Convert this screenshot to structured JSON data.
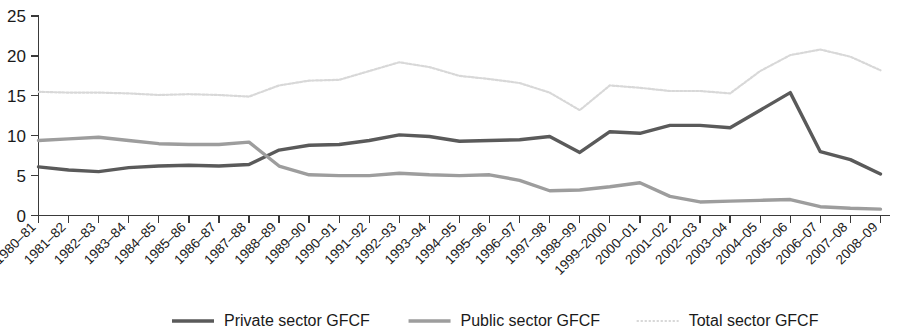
{
  "chart_data": {
    "type": "line",
    "title": "",
    "subtitle": "",
    "xlabel": "",
    "ylabel": "",
    "ylim": [
      0,
      25
    ],
    "yticks": [
      0,
      5,
      10,
      15,
      20,
      25
    ],
    "grid": false,
    "legend_position": "bottom",
    "categories": [
      "1980–81",
      "1981–82",
      "1982–83",
      "1983–84",
      "1984–85",
      "1985–86",
      "1986–87",
      "1987–88",
      "1988–89",
      "1989–90",
      "1990–91",
      "1991–92",
      "1992–93",
      "1993–94",
      "1994–95",
      "1995–96",
      "1996–97",
      "1997–98",
      "1998–99",
      "1999–2000",
      "2000–01",
      "2001–02",
      "2002–03",
      "2003–04",
      "2004–05",
      "2005–06",
      "2006–07",
      "2007–08",
      "2008–09"
    ],
    "series": [
      {
        "name": "Private sector GFCF",
        "color": "#5a5a5a",
        "width": 3.4,
        "dash": "",
        "values": [
          6.1,
          5.7,
          5.5,
          6.0,
          6.2,
          6.3,
          6.2,
          6.4,
          8.2,
          8.8,
          8.9,
          9.4,
          10.1,
          9.9,
          9.3,
          9.4,
          9.5,
          9.9,
          7.9,
          10.5,
          10.3,
          11.3,
          11.3,
          11.0,
          13.2,
          15.4,
          8.0,
          7.0,
          5.2
        ]
      },
      {
        "name": "Public sector GFCF",
        "color": "#9d9d9d",
        "width": 3.4,
        "dash": "",
        "values": [
          9.4,
          9.6,
          9.8,
          9.4,
          9.0,
          8.9,
          8.9,
          9.2,
          6.2,
          5.1,
          5.0,
          5.0,
          5.3,
          5.1,
          5.0,
          5.1,
          4.4,
          3.1,
          3.2,
          3.6,
          4.1,
          2.4,
          1.7,
          1.8,
          1.9,
          2.0,
          1.1,
          0.9,
          0.8
        ]
      },
      {
        "name": "Total sector GFCF",
        "color": "#d8d8d8",
        "width": 2.2,
        "dash": "2.2 1.8",
        "values": [
          15.5,
          15.4,
          15.4,
          15.3,
          15.1,
          15.2,
          15.1,
          14.9,
          16.3,
          16.9,
          17.0,
          18.1,
          19.2,
          18.6,
          17.5,
          17.1,
          16.6,
          15.4,
          13.2,
          16.3,
          16.0,
          15.6,
          15.6,
          15.3,
          18.1,
          20.1,
          20.8,
          19.9,
          18.2
        ]
      }
    ]
  },
  "legend": {
    "items": [
      {
        "label": "Private sector GFCF"
      },
      {
        "label": "Public sector GFCF"
      },
      {
        "label": "Total sector GFCF"
      }
    ]
  }
}
